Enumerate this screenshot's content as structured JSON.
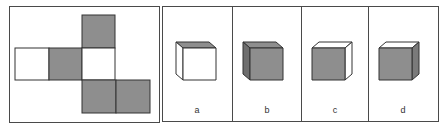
{
  "colors": {
    "grey_face": "#8e8e8e",
    "dark_grey_face": "#7a7a7a",
    "white_face": "#ffffff",
    "outline": "#333333"
  },
  "net": {
    "description": "unfolded cube net",
    "squares": [
      {
        "id": "top",
        "fill": "grey"
      },
      {
        "id": "left",
        "fill": "white"
      },
      {
        "id": "center-left",
        "fill": "grey"
      },
      {
        "id": "center",
        "fill": "white"
      },
      {
        "id": "bottom",
        "fill": "grey"
      },
      {
        "id": "bottom-right",
        "fill": "grey"
      }
    ]
  },
  "options": [
    {
      "label": "a",
      "top": "grey",
      "front": "white",
      "side": "white"
    },
    {
      "label": "b",
      "top": "grey",
      "front": "grey",
      "side": "grey"
    },
    {
      "label": "c",
      "top": "white",
      "front": "grey",
      "side": "white"
    },
    {
      "label": "d",
      "top": "white",
      "front": "grey",
      "side": "grey"
    }
  ]
}
